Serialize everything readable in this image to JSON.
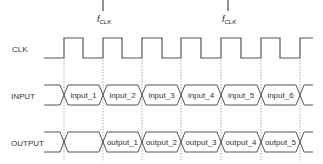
{
  "diagram": {
    "colors": {
      "line": "#555555",
      "dotted": "#888888",
      "text": "#333333"
    },
    "signals": [
      {
        "name": "CLK",
        "y_label": 50
      },
      {
        "name": "INPUT",
        "y_label": 97
      },
      {
        "name": "OUTPUT",
        "y_label": 144
      }
    ],
    "clock": {
      "start_x": 44,
      "end_x": 313,
      "low_y": 58,
      "high_y": 38,
      "rising_edges": [
        64,
        103,
        142,
        181,
        221,
        261,
        300
      ],
      "falling_edges": [
        83,
        122,
        162,
        201,
        241,
        280
      ]
    },
    "clock_markers": [
      {
        "x": 103,
        "label": "f",
        "subscript": "CLK"
      },
      {
        "x": 228,
        "label": "f",
        "subscript": "CLK"
      }
    ],
    "input_bus": {
      "top_y": 85,
      "bottom_y": 105,
      "crossings": [
        64,
        103,
        142,
        181,
        221,
        261,
        300
      ],
      "start_x": 44,
      "end_x": 313,
      "values": [
        "input_1",
        "input_2",
        "input_3",
        "input_4",
        "input_5",
        "input_6"
      ]
    },
    "output_bus": {
      "top_y": 132,
      "bottom_y": 152,
      "crossings": [
        64,
        103,
        142,
        181,
        221,
        261,
        300
      ],
      "start_x": 44,
      "end_x": 313,
      "values": [
        "",
        "output_1",
        "output_2",
        "output_3",
        "output_4",
        "output_5"
      ]
    },
    "dotted_lines": {
      "xs": [
        64,
        103,
        142,
        181,
        221,
        261,
        300
      ],
      "top_y": 60,
      "bottom_y": 162
    }
  }
}
